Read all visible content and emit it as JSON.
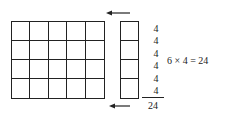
{
  "diagram": {
    "grid": {
      "rows": 4,
      "columns": 5
    },
    "column": {
      "rows": 4
    },
    "addends": [
      "4",
      "4",
      "4",
      "4",
      "4",
      "4"
    ],
    "total": "24",
    "equation": "6 × 4 = 24",
    "arrows": [
      "left-arrow-top",
      "left-arrow-bottom"
    ]
  }
}
